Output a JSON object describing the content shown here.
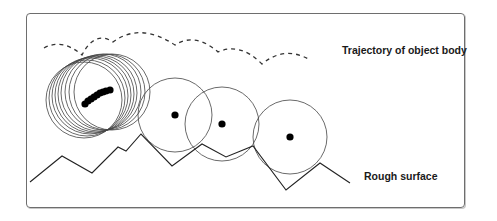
{
  "diagram": {
    "labels": {
      "trajectory": "Trajectory of object body",
      "surface": "Rough surface"
    },
    "colors": {
      "stroke": "#333333",
      "dot": "#000000",
      "frame": "#6e6e6e"
    },
    "surface_points": [
      [
        30,
        182
      ],
      [
        62,
        156
      ],
      [
        92,
        173
      ],
      [
        118,
        147
      ],
      [
        126,
        151
      ],
      [
        141,
        134
      ],
      [
        172,
        166
      ],
      [
        202,
        144
      ],
      [
        226,
        157
      ],
      [
        253,
        146
      ],
      [
        286,
        190
      ],
      [
        320,
        163
      ],
      [
        350,
        183
      ]
    ],
    "trajectory_path": "M44,48 Q62,38 82,55 Q95,30 113,42 Q140,22 175,45 Q195,32 218,52 Q240,42 262,64 Q285,45 310,60",
    "circle_cluster": [
      {
        "cx": 84,
        "cy": 100,
        "r": 38
      },
      {
        "cx": 87,
        "cy": 98,
        "r": 38
      },
      {
        "cx": 90,
        "cy": 96,
        "r": 38
      },
      {
        "cx": 93,
        "cy": 95,
        "r": 38
      },
      {
        "cx": 96,
        "cy": 94,
        "r": 38
      },
      {
        "cx": 99,
        "cy": 93,
        "r": 38
      },
      {
        "cx": 103,
        "cy": 92,
        "r": 38
      },
      {
        "cx": 107,
        "cy": 92,
        "r": 38
      },
      {
        "cx": 112,
        "cy": 92,
        "r": 38
      }
    ],
    "cluster_dots": [
      [
        85,
        104
      ],
      [
        88,
        101
      ],
      [
        91,
        99
      ],
      [
        94,
        97
      ],
      [
        97,
        95
      ],
      [
        100,
        93
      ],
      [
        103,
        92
      ],
      [
        106,
        91
      ],
      [
        110,
        90
      ]
    ],
    "single_circles": [
      {
        "cx": 175,
        "cy": 115,
        "r": 37,
        "dot": [
          175,
          115
        ]
      },
      {
        "cx": 222,
        "cy": 124,
        "r": 37,
        "dot": [
          222,
          124
        ]
      },
      {
        "cx": 290,
        "cy": 137,
        "r": 37,
        "dot": [
          290,
          137
        ]
      }
    ]
  }
}
